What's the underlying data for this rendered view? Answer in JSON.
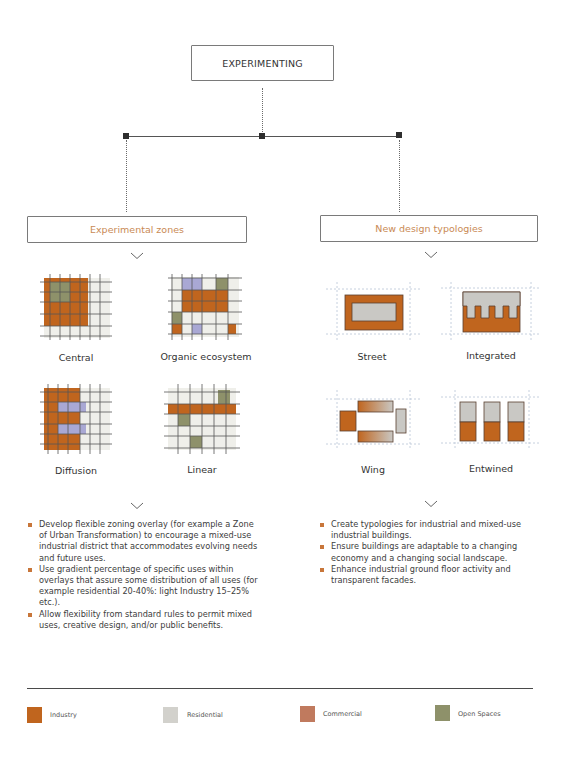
{
  "header": {
    "title": "EXPERIMENTING"
  },
  "colors": {
    "industry": "#c0651e",
    "residential": "#efefea",
    "commercial": "#c07a5e",
    "open_space": "#8e916a",
    "lavender": "#a9a8d4",
    "grey_block": "#c9c8c4",
    "accent_text": "#c98a55",
    "bullet": "#c8763a"
  },
  "branches": [
    {
      "title": "Experimental zones",
      "items": [
        {
          "label": "Central"
        },
        {
          "label": "Organic ecosystem"
        },
        {
          "label": "Diffusion"
        },
        {
          "label": "Linear"
        }
      ],
      "bullets": [
        "Develop flexible zoning overlay (for example a Zone of Urban Transformation) to encourage a mixed-use industrial district that accommodates evolving needs and future uses.",
        "Use gradient percentage of specific uses within overlays that assure some distribution of all uses (for example residential 20-40%: light Industry 15–25% etc.).",
        "Allow flexibility from standard rules to permit mixed uses, creative design, and/or public benefits."
      ]
    },
    {
      "title": "New design typologies",
      "items": [
        {
          "label": "Street"
        },
        {
          "label": "Integrated"
        },
        {
          "label": "Wing"
        },
        {
          "label": "Entwined"
        }
      ],
      "bullets": [
        "Create typologies for industrial and mixed-use industrial buildings.",
        "Ensure buildings are adaptable to a changing economy and a changing social landscape.",
        "Enhance industrial ground floor activity and transparent facades."
      ]
    }
  ],
  "grids": {
    "central": [
      "IIIIRR",
      "IOOIIR",
      "IOOIIR",
      "IIIIIR",
      "IIIIIR",
      "RRRRRR"
    ],
    "organic": [
      "RLLROR",
      "RIIIIR",
      "RIIIIR",
      "ORRRRR",
      "IRLRRI"
    ],
    "diffusion": [
      "IIIRRR",
      "ILLLRR",
      "IIIRRR",
      "ILLLRR",
      "IIIRRR",
      "RRRRRR"
    ],
    "linear": [
      "RRRRGR",
      "IIIIII",
      "RGRRRR",
      "RRRRRR",
      "RRGRRR",
      "RRRRRR"
    ]
  },
  "legend": [
    {
      "label": "Industry",
      "color": "#c0651e"
    },
    {
      "label": "Residential",
      "color": "#d2d1cc"
    },
    {
      "label": "Commercial",
      "color": "#c07a5e"
    },
    {
      "label": "Open Spaces",
      "color": "#8e916a"
    }
  ]
}
